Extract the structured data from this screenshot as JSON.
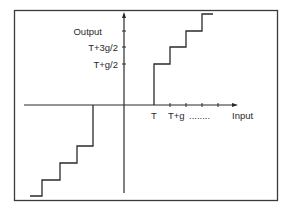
{
  "diagram": {
    "type": "quantizer-transfer-characteristic",
    "y_axis": {
      "title": "Output",
      "tick_labels": [
        "T+3g/2",
        "T+g/2"
      ]
    },
    "x_axis": {
      "title": "Input",
      "tick_labels": [
        "T",
        "T+g",
        "........"
      ]
    },
    "colors": {
      "line": "#2a2a2a",
      "background": "#ffffff",
      "frame": "#3a3a3a"
    }
  }
}
